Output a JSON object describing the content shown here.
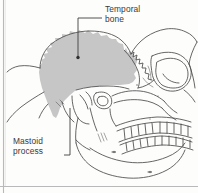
{
  "figure": {
    "kind": "anatomical-illustration",
    "background_color": "#fdfdfc",
    "border_color": "#b9b9b9",
    "outline_color": "#4a4a4a",
    "highlight_fill": "#c6c6c6",
    "text_color": "#3a3a3a",
    "leader_color": "#3f3f3f"
  },
  "labels": {
    "temporal_bone": {
      "line1": "Temporal",
      "line2": "bone",
      "full": "Temporal bone"
    },
    "mastoid_process": {
      "line1": "Mastoid",
      "line2": "process",
      "full": "Mastoid process"
    }
  },
  "icons": {
    "temporal_leader": "leader-line-icon",
    "mastoid_leader": "leader-line-icon",
    "temporal_dot": "callout-dot-icon"
  }
}
